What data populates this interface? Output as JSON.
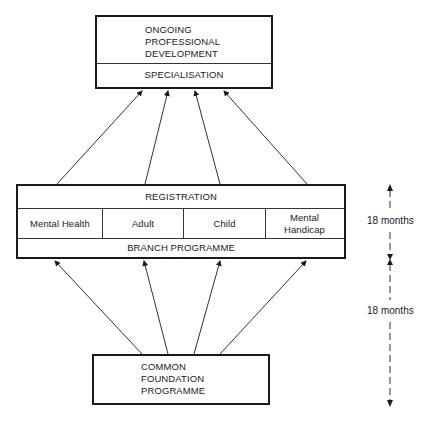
{
  "diagram": {
    "top_box": {
      "title_lines": [
        "ONGOING",
        "PROFESSIONAL",
        "DEVELOPMENT"
      ],
      "subtitle": "SPECIALISATION"
    },
    "middle_box": {
      "header": "REGISTRATION",
      "branches": [
        "Mental Health",
        "Adult",
        "Child",
        "Mental Handicap"
      ],
      "branch_lines": {
        "mental_handicap": [
          "Mental",
          "Handicap"
        ]
      },
      "footer": "BRANCH PROGRAMME"
    },
    "bottom_box": {
      "title_lines": [
        "COMMON",
        "FOUNDATION",
        "PROGRAMME"
      ]
    },
    "durations": [
      {
        "label": "18 months",
        "span": "branch programme"
      },
      {
        "label": "18 months",
        "span": "common foundation programme"
      }
    ],
    "arrows": {
      "middle_to_top": 4,
      "bottom_to_middle": 4
    },
    "colors": {
      "ink": "#1a1a1a",
      "background": "#ffffff"
    }
  }
}
